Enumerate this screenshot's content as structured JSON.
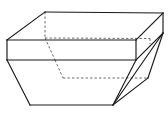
{
  "figure": {
    "shape_type": "composite-solid",
    "background_color": "#ffffff",
    "visible_edge_color": "#1a1a1a",
    "hidden_edge_color": "#5a5a5a",
    "canvas": {
      "width": 168,
      "height": 116
    },
    "vertices": {
      "top_front_left": [
        7,
        40
      ],
      "top_back_left": [
        45,
        12
      ],
      "top_back_right": [
        163,
        13
      ],
      "top_front_right": [
        136,
        40
      ],
      "band_front_left": [
        7,
        60
      ],
      "band_front_right": [
        136,
        60
      ],
      "band_back_left_hidden": [
        55,
        60
      ],
      "band_back_right_hidden": [
        169,
        60
      ],
      "base_front_left": [
        30,
        105
      ],
      "base_front_right": [
        113,
        105
      ],
      "base_back_left_hidden": [
        63,
        78
      ],
      "base_back_right_hidden": [
        148,
        78
      ]
    },
    "edges": {
      "top_face": [
        "top_front_left-top_back_left",
        "top_back_left-top_back_right",
        "top_back_right-top_front_right",
        "top_front_right-top_front_left"
      ],
      "band_front": [
        "top_front_left-band_front_left",
        "band_front_left-band_front_right",
        "band_front_right-top_front_right"
      ],
      "band_right_side": [
        "top_back_right-band_back_right_hidden"
      ],
      "frustum_front": [
        "band_front_left-base_front_left",
        "base_front_left-base_front_right",
        "base_front_right-band_front_right"
      ],
      "frustum_right": [
        "base_front_right-top_back_right",
        "base_front_right-base_back_right_hidden"
      ],
      "hidden": [
        "top_back_left-band_back_left_hidden",
        "band_back_left_hidden-base_back_left_hidden",
        "base_back_left_hidden-base_back_right_hidden",
        "top_back_left-top_front_right_dashed_span",
        "band_back_left_hidden-band_back_right_hidden"
      ]
    }
  }
}
